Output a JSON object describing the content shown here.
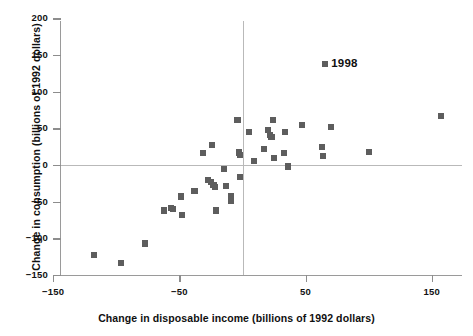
{
  "chart_data": {
    "type": "scatter",
    "title": "",
    "xlabel": "Change in disposable income (billions of 1992 dollars)",
    "ylabel": "Change in consumption (billions of 1992 dollars)",
    "xlim": [
      -150,
      168
    ],
    "ylim": [
      -150,
      200
    ],
    "xticks": [
      -150,
      -50,
      50,
      150
    ],
    "xtick_labels": [
      "−150",
      "−50",
      "50",
      "150"
    ],
    "yticks": [
      200,
      150,
      100,
      50,
      0,
      -50,
      -100,
      -150
    ],
    "ytick_labels": [
      "200",
      "150",
      "100",
      "50",
      "0",
      "−50",
      "−100",
      "−150"
    ],
    "grid": "zero-lines-only",
    "marker_color": "#5d5d5d",
    "marker_shape": "square",
    "legend": {
      "position": "upper-right-inside",
      "entries": [
        {
          "label": "1998",
          "color": "#5d5d5d"
        }
      ]
    },
    "series": [
      {
        "name": "1998",
        "points": [
          {
            "x": -118,
            "y": -123
          },
          {
            "x": -96,
            "y": -134
          },
          {
            "x": -77,
            "y": -107
          },
          {
            "x": -62,
            "y": -62
          },
          {
            "x": -57,
            "y": -59
          },
          {
            "x": -55,
            "y": -60
          },
          {
            "x": -49,
            "y": -43
          },
          {
            "x": -48,
            "y": -68
          },
          {
            "x": -38,
            "y": -35
          },
          {
            "x": -31,
            "y": 16
          },
          {
            "x": -27,
            "y": -21
          },
          {
            "x": -25,
            "y": -23
          },
          {
            "x": -24,
            "y": 27
          },
          {
            "x": -23,
            "y": -27
          },
          {
            "x": -22,
            "y": -30
          },
          {
            "x": -21,
            "y": -62
          },
          {
            "x": -15,
            "y": -5
          },
          {
            "x": -13,
            "y": -29
          },
          {
            "x": -9,
            "y": -43
          },
          {
            "x": -9,
            "y": -49
          },
          {
            "x": -4,
            "y": 61
          },
          {
            "x": -3,
            "y": 17
          },
          {
            "x": -2,
            "y": 14
          },
          {
            "x": -2,
            "y": -16
          },
          {
            "x": 5,
            "y": 45
          },
          {
            "x": 9,
            "y": 5
          },
          {
            "x": 17,
            "y": 22
          },
          {
            "x": 20,
            "y": 48
          },
          {
            "x": 22,
            "y": 41
          },
          {
            "x": 23,
            "y": 38
          },
          {
            "x": 24,
            "y": 61
          },
          {
            "x": 25,
            "y": 10
          },
          {
            "x": 33,
            "y": 16
          },
          {
            "x": 34,
            "y": 45
          },
          {
            "x": 36,
            "y": -2
          },
          {
            "x": 47,
            "y": 55
          },
          {
            "x": 63,
            "y": 25
          },
          {
            "x": 64,
            "y": 12
          },
          {
            "x": 70,
            "y": 52
          },
          {
            "x": 100,
            "y": 18
          },
          {
            "x": 157,
            "y": 67
          }
        ]
      }
    ]
  }
}
